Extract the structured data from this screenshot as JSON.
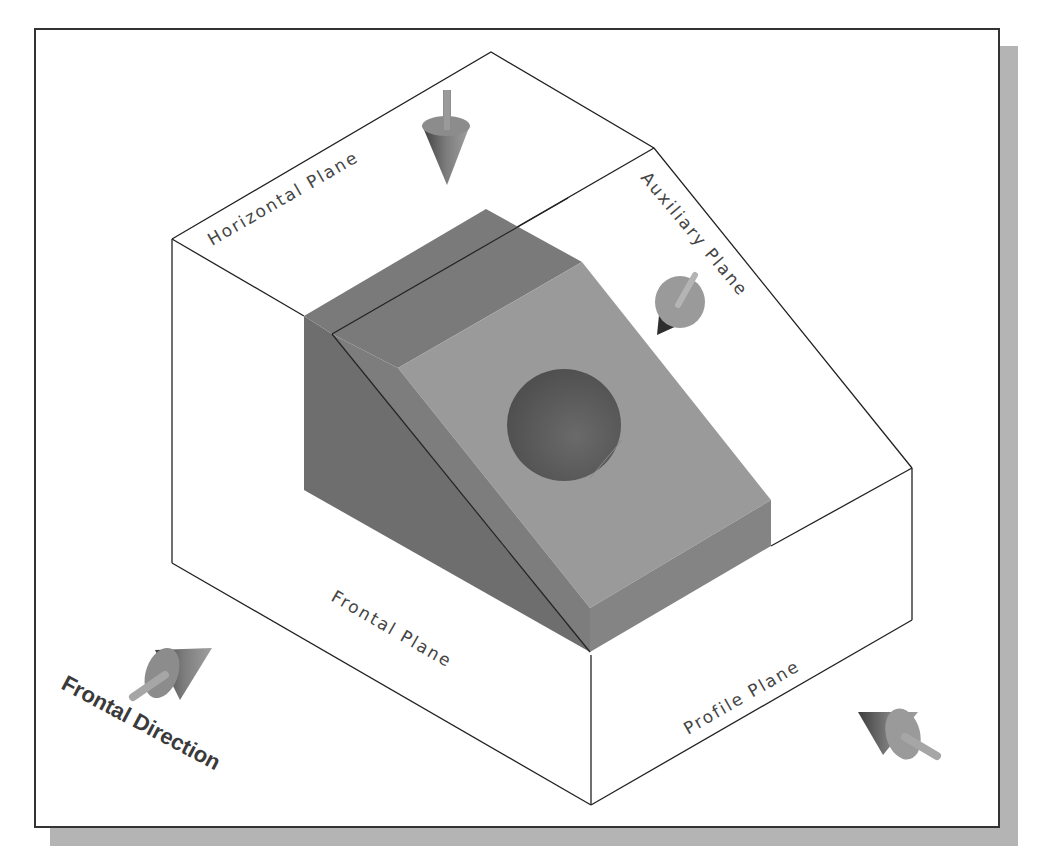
{
  "diagram": {
    "type": "isometric projection planes illustration",
    "labels": {
      "horizontal_plane": "Horizontal Plane",
      "auxiliary_plane": "Auxiliary Plane",
      "frontal_plane": "Frontal Plane",
      "profile_plane": "Profile Plane",
      "frontal_direction": "Frontal Direction"
    },
    "colors": {
      "background": "#ffffff",
      "frame_border": "#333333",
      "frame_shadow": "#b4b4b4",
      "object_dark": "#6e6e6e",
      "object_light": "#999999",
      "object_top": "#7a7a7a",
      "hole": "#5a5a5a",
      "arrow": "#8a8a8a",
      "line": "#222222"
    },
    "arrows": [
      {
        "name": "horizontal-view-arrow",
        "direction": "down"
      },
      {
        "name": "auxiliary-view-arrow",
        "direction": "perpendicular-to-incline"
      },
      {
        "name": "frontal-view-arrow",
        "direction": "toward-frontal-plane"
      },
      {
        "name": "profile-view-arrow",
        "direction": "toward-profile-plane"
      }
    ]
  }
}
